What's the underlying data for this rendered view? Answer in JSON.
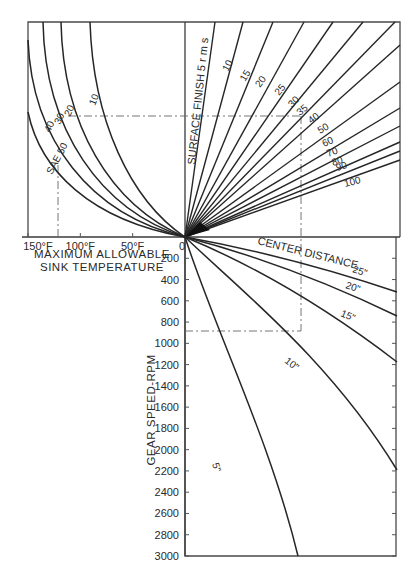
{
  "chart_data": {
    "type": "line",
    "title": "",
    "colors": {
      "line": "#262626",
      "frame": "#4a4a4a",
      "guide": "#666666",
      "background": "#ffffff"
    },
    "quadrants": {
      "upper_left": {
        "xlabel": "MAXIMUM ALLOWABLE\nSINK TEMPERATURE",
        "xlabel_line1": "MAXIMUM ALLOWABLE",
        "xlabel_line2": "SINK TEMPERATURE",
        "x_ticks": [
          "150°F",
          "100°F",
          "50°F",
          "0"
        ],
        "x_tick_values": [
          150,
          100,
          50,
          0
        ],
        "series_prefix": "SAE",
        "series": [
          {
            "name": "SAE 50",
            "label": "SAE 50",
            "top_x": 28,
            "top_y": 40
          },
          {
            "name": "SAE 40",
            "label": "40",
            "top_x": 43,
            "top_y": 22
          },
          {
            "name": "SAE 30",
            "label": "30",
            "top_x": 61,
            "top_y": 22
          },
          {
            "name": "SAE 20",
            "label": "20",
            "top_x": 61,
            "top_y": 22
          },
          {
            "name": "SAE 10",
            "label": "10",
            "top_x": 90,
            "top_y": 22
          }
        ]
      },
      "upper_right": {
        "label": "SURFACE FINISH  5 r m s",
        "series": [
          {
            "name": "5 rms",
            "label": "5 rms",
            "end_x": 215,
            "end_y": 22
          },
          {
            "name": "10 rms",
            "label": "10",
            "end_x": 243,
            "end_y": 22
          },
          {
            "name": "15 rms",
            "label": "15",
            "end_x": 273,
            "end_y": 22
          },
          {
            "name": "20 rms",
            "label": "20",
            "end_x": 304,
            "end_y": 22
          },
          {
            "name": "25 rms",
            "label": "25",
            "end_x": 333,
            "end_y": 22
          },
          {
            "name": "30 rms",
            "label": "30",
            "end_x": 363,
            "end_y": 22
          },
          {
            "name": "35 rms",
            "label": "35",
            "end_x": 395,
            "end_y": 22
          },
          {
            "name": "40 rms",
            "label": "40",
            "end_x": 400,
            "end_y": 45
          },
          {
            "name": "50 rms",
            "label": "50",
            "end_x": 400,
            "end_y": 82
          },
          {
            "name": "60 rms",
            "label": "60",
            "end_x": 400,
            "end_y": 108
          },
          {
            "name": "70 rms",
            "label": "70",
            "end_x": 400,
            "end_y": 126
          },
          {
            "name": "80 rms",
            "label": "80",
            "end_x": 400,
            "end_y": 142
          },
          {
            "name": "90 rms",
            "label": "90",
            "end_x": 400,
            "end_y": 151
          },
          {
            "name": "100 rms",
            "label": "100",
            "end_x": 400,
            "end_y": 160
          }
        ]
      },
      "lower_right": {
        "label": "CENTER DISTANCE",
        "series": [
          {
            "name": "25 in",
            "label": "25\"",
            "end_x": 397,
            "end_y": 292
          },
          {
            "name": "20 in",
            "label": "20\"",
            "end_x": 397,
            "end_y": 316
          },
          {
            "name": "15 in",
            "label": "15\"",
            "end_x": 397,
            "end_y": 362
          },
          {
            "name": "10 in",
            "label": "10\"",
            "end_x": 397,
            "end_y": 470
          },
          {
            "name": "5 in",
            "label": "5\"",
            "end_x": 298,
            "end_y": 556
          }
        ]
      },
      "lower_left_axis": {
        "ylabel": "GEAR SPEED-RPM",
        "y_ticks": [
          0,
          200,
          400,
          600,
          800,
          1000,
          1200,
          1400,
          1600,
          1800,
          2000,
          2200,
          2400,
          2600,
          2800,
          3000
        ],
        "ylim": [
          0,
          3000
        ]
      }
    },
    "example_path": {
      "sink_temperature_F": 120,
      "gear_speed_rpm": 900,
      "center_distance_in": 10,
      "surface_finish_rms": 35,
      "oil": "SAE 20"
    },
    "grid": false,
    "legend": "inline labels"
  }
}
